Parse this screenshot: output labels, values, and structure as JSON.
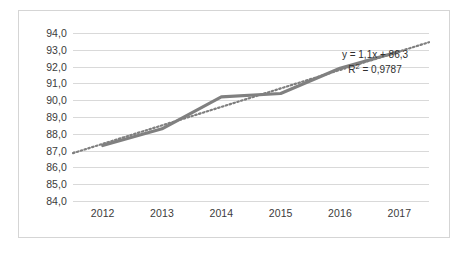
{
  "chart_data": {
    "type": "line",
    "title": "",
    "subtitle": "",
    "xlabel": "",
    "ylabel": "",
    "categories": [
      "2012",
      "2013",
      "2014",
      "2015",
      "2016",
      "2017"
    ],
    "x": [
      2012,
      2013,
      2014,
      2015,
      2016,
      2017
    ],
    "ylim": [
      84.0,
      94.0
    ],
    "y_tick_step": 1.0,
    "decimal_separator": ",",
    "grid": true,
    "grid_axis": "y",
    "legend": "none",
    "legend_position": "none",
    "y_tick_labels": [
      "94,0",
      "93,0",
      "92,0",
      "91,0",
      "90,0",
      "89,0",
      "88,0",
      "87,0",
      "86,0",
      "85,0",
      "84,0"
    ],
    "x_tick_labels": [
      "2012",
      "2013",
      "2014",
      "2015",
      "2016",
      "2017"
    ],
    "series": [
      {
        "name": "data-series",
        "style": "solid",
        "color": "#808080",
        "values": [
          87.3,
          88.3,
          90.2,
          90.4,
          91.9,
          92.9
        ]
      },
      {
        "name": "linear-trendline",
        "style": "dotted",
        "color": "#7f7f7f",
        "values": [
          87.4,
          88.5,
          89.6,
          90.7,
          91.8,
          92.9
        ]
      }
    ],
    "annotations": [
      {
        "name": "trendline-equation",
        "equation": "y = 1,1x + 86,3",
        "r_squared_prefix": "R",
        "r_squared_exponent": "2",
        "r_squared_value": "= 0,9787"
      }
    ]
  },
  "colors": {
    "series_line": "#808080",
    "trendline": "#7f7f7f",
    "gridline": "#d9d9d9",
    "frame_border": "#d5d5d5",
    "tick_text": "#3b3b3b",
    "annotation_text": "#2f2f2f",
    "background": "#ffffff"
  }
}
